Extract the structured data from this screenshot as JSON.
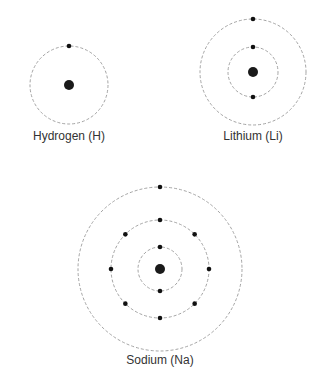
{
  "colors": {
    "orbit": "#9a9a9a",
    "electron": "#111111",
    "nucleus": "#1a1a1a",
    "label": "#333333"
  },
  "atoms": [
    {
      "name": "Hydrogen (H)",
      "cx": 69,
      "cy": 85,
      "nucleus_r": 5,
      "label_y": 129,
      "shells": [
        {
          "r": 39,
          "electrons": 1
        }
      ]
    },
    {
      "name": "Lithium (Li)",
      "cx": 253,
      "cy": 72,
      "nucleus_r": 5,
      "label_y": 129,
      "shells": [
        {
          "r": 25,
          "electrons": 2
        },
        {
          "r": 53,
          "electrons": 1
        }
      ]
    },
    {
      "name": "Sodium (Na)",
      "cx": 160,
      "cy": 269,
      "nucleus_r": 5,
      "label_y": 353,
      "shells": [
        {
          "r": 22,
          "electrons": 2
        },
        {
          "r": 49,
          "electrons": 8
        },
        {
          "r": 82,
          "electrons": 1
        }
      ]
    }
  ]
}
